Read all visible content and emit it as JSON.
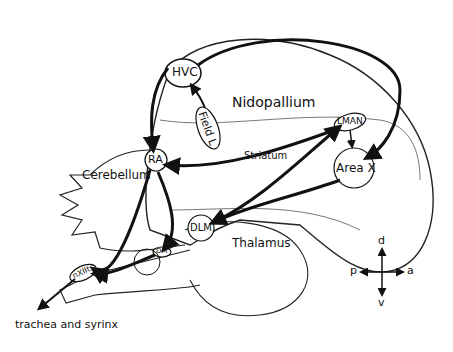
{
  "diagram": {
    "type": "songbird brain song system (sagittal view)",
    "regions": {
      "nidopallium": "Nidopallium",
      "striatum": "Striatum",
      "cerebellum": "Cerebellum",
      "thalamus": "Thalamus"
    },
    "nuclei": {
      "hvc": "HVC",
      "field_l": "Field L",
      "lman": "LMAN",
      "ra": "RA",
      "area_x": "Area X",
      "dlm": "DLM",
      "dm": "DM",
      "nxiits": "nXIIts"
    },
    "output_label": "trachea and syrinx",
    "compass": {
      "dorsal": "d",
      "ventral": "v",
      "posterior": "p",
      "anterior": "a"
    },
    "connections": [
      [
        "Field L",
        "HVC"
      ],
      [
        "HVC",
        "RA"
      ],
      [
        "HVC",
        "Area X"
      ],
      [
        "Area X",
        "DLM"
      ],
      [
        "DLM",
        "LMAN"
      ],
      [
        "LMAN",
        "RA"
      ],
      [
        "LMAN",
        "Area X"
      ],
      [
        "RA",
        "DM"
      ],
      [
        "RA",
        "nXIIts"
      ],
      [
        "DM",
        "nXIIts"
      ],
      [
        "nXIIts",
        "trachea and syrinx"
      ]
    ]
  }
}
